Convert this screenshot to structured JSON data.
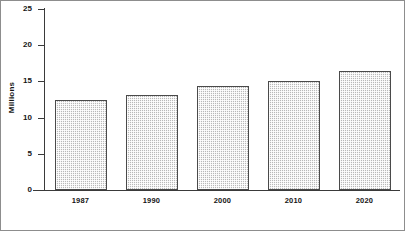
{
  "chart_data": {
    "type": "bar",
    "title": "",
    "subtitle": "",
    "xlabel": "",
    "ylabel": "Millions",
    "categories": [
      "1987",
      "1990",
      "2000",
      "2010",
      "2020"
    ],
    "values": [
      12.4,
      13.1,
      14.4,
      15.0,
      16.4
    ],
    "series": [
      {
        "name": "Millions",
        "values": [
          12.4,
          13.1,
          14.4,
          15.0,
          16.4
        ]
      }
    ],
    "ylim": [
      0,
      25
    ],
    "yticks": [
      0,
      5,
      10,
      15,
      20,
      25
    ],
    "ytick_labels": [
      "0",
      "5",
      "10",
      "15",
      "20",
      "25"
    ],
    "grid": false,
    "legend": false,
    "legend_position": "none",
    "bar_fill_color": "#b9b9b9",
    "bar_edge_color": "#4a4a4a",
    "axis_color": "#3a3a3a",
    "background_color": "#ffffff"
  }
}
